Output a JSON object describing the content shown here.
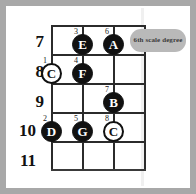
{
  "diagram": {
    "fret_numbers": [
      "7",
      "8",
      "9",
      "10",
      "11"
    ],
    "callout": {
      "text": "6th scale degree"
    },
    "notes": [
      {
        "letter": "E",
        "degree": "3",
        "style": "filled",
        "string": 2,
        "fret": "7"
      },
      {
        "letter": "A",
        "degree": "6",
        "style": "filled",
        "string": 3,
        "fret": "7"
      },
      {
        "letter": "C",
        "degree": "1",
        "style": "hollow",
        "string": 1,
        "fret": "8"
      },
      {
        "letter": "F",
        "degree": "4",
        "style": "filled",
        "string": 2,
        "fret": "8"
      },
      {
        "letter": "B",
        "degree": "7",
        "style": "filled",
        "string": 3,
        "fret": "9"
      },
      {
        "letter": "D",
        "degree": "2",
        "style": "filled",
        "string": 1,
        "fret": "10"
      },
      {
        "letter": "G",
        "degree": "5",
        "style": "filled",
        "string": 2,
        "fret": "10"
      },
      {
        "letter": "C",
        "degree": "8",
        "style": "hollow",
        "string": 3,
        "fret": "10"
      }
    ]
  },
  "colors": {
    "frame": "#a8a8a8",
    "line": "#2b2b2b",
    "note_fill": "#111111",
    "callout_bg": "#b9b9b9",
    "callout_text": "#3b3b3b"
  }
}
